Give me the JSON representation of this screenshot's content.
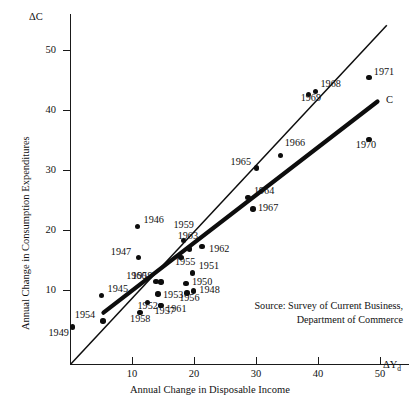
{
  "figure": {
    "y_axis_symbol": "ΔC",
    "x_axis_symbol": "ΔY",
    "x_axis_symbol_sub": "d",
    "y_axis_title": "Annual Change in Consumption Expenditures",
    "x_axis_title": "Annual Change in Disposable Income",
    "consumption_line_label": "C",
    "source_line1": "Source: Survey of Current Business,",
    "source_line2": "Department of Commerce"
  },
  "chart_data": {
    "type": "scatter",
    "title": "",
    "xlabel": "Annual Change in Disposable Income",
    "ylabel": "Annual Change in Consumption Expenditures",
    "xlim": [
      0,
      58
    ],
    "ylim": [
      0,
      56
    ],
    "xticks": [
      10,
      20,
      30,
      40,
      50
    ],
    "yticks": [
      10,
      20,
      30,
      40,
      50
    ],
    "grid": false,
    "legend": "none",
    "annotations": [
      "Source: Survey of Current Business,",
      "Department of Commerce"
    ],
    "series": [
      {
        "name": "Annual changes by year",
        "points": [
          {
            "label": "1945",
            "x": 5.0,
            "y": 11.5
          },
          {
            "label": "1946",
            "x": 10.8,
            "y": 23.0
          },
          {
            "label": "1947",
            "x": 11.0,
            "y": 17.8
          },
          {
            "label": "1948",
            "x": 19.8,
            "y": 12.2
          },
          {
            "label": "1949",
            "x": 0.3,
            "y": 6.2
          },
          {
            "label": "1950",
            "x": 18.6,
            "y": 13.5
          },
          {
            "label": "1951",
            "x": 19.7,
            "y": 15.2
          },
          {
            "label": "1952",
            "x": 12.4,
            "y": 10.3
          },
          {
            "label": "1953",
            "x": 14.1,
            "y": 11.7
          },
          {
            "label": "1954",
            "x": 5.2,
            "y": 7.2
          },
          {
            "label": "1955",
            "x": 17.8,
            "y": 17.8
          },
          {
            "label": "1956",
            "x": 18.8,
            "y": 11.9
          },
          {
            "label": "1957",
            "x": 14.5,
            "y": 9.8
          },
          {
            "label": "1958",
            "x": 11.2,
            "y": 8.6
          },
          {
            "label": "1959",
            "x": 18.2,
            "y": 20.6
          },
          {
            "label": "1959",
            "x": 14.6,
            "y": 13.7
          },
          {
            "label": "1960",
            "x": 13.8,
            "y": 13.8
          },
          {
            "label": "1961",
            "x": 14.6,
            "y": 9.8
          },
          {
            "label": "1962",
            "x": 21.2,
            "y": 19.6
          },
          {
            "label": "1963",
            "x": 19.2,
            "y": 19.2
          },
          {
            "label": "1964",
            "x": 28.6,
            "y": 27.8
          },
          {
            "label": "1965",
            "x": 30.0,
            "y": 32.7
          },
          {
            "label": "1966",
            "x": 33.9,
            "y": 34.8
          },
          {
            "label": "1967",
            "x": 29.4,
            "y": 25.9
          },
          {
            "label": "1968",
            "x": 39.5,
            "y": 45.5
          },
          {
            "label": "1969",
            "x": 38.4,
            "y": 45.0
          },
          {
            "label": "1970",
            "x": 48.1,
            "y": 37.5
          },
          {
            "label": "1971",
            "x": 48.1,
            "y": 47.8
          }
        ]
      }
    ],
    "lines": [
      {
        "name": "45-degree reference line",
        "from": [
          0,
          0
        ],
        "to": [
          51,
          56.5
        ],
        "style": "thin"
      },
      {
        "name": "consumption function C",
        "from": [
          5.3,
          8.6
        ],
        "to": [
          49.5,
          43.8
        ],
        "style": "thick"
      }
    ]
  }
}
